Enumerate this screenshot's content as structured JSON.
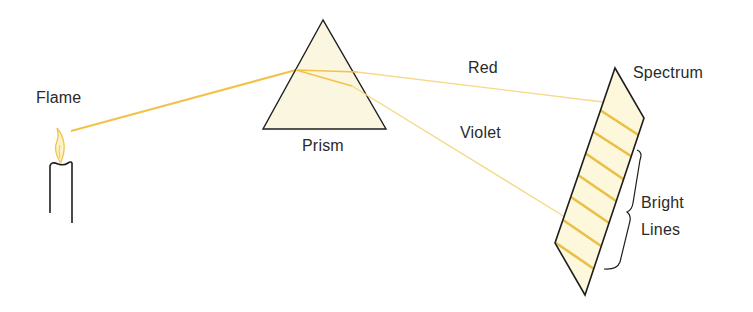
{
  "diagram": {
    "labels": {
      "flame": "Flame",
      "prism": "Prism",
      "red": "Red",
      "violet": "Violet",
      "spectrum": "Spectrum",
      "bright": "Bright",
      "lines": "Lines"
    },
    "colors": {
      "light_ray": "#f2c24a",
      "light_ray_faint": "#f5d98a",
      "prism_fill": "#fbf6df",
      "spectrum_fill": "#fdf8dc",
      "bright_line": "#e9bf45",
      "outline": "#1e1e1e",
      "flame": "#f0c64e",
      "text": "#2a2a2a"
    },
    "bright_line_count": 7
  }
}
